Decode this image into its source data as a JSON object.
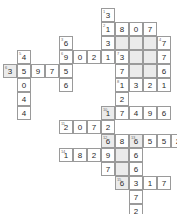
{
  "puzzle": {
    "kind": "number-crossword-grid",
    "title": "",
    "cell_size_px": 14,
    "origin_x_px": 3,
    "origin_y_px": 8,
    "colors": {
      "cell_background": "#ffffff",
      "shaded_background": "#ebebeb",
      "border": "#9a9a9a",
      "digit_text": "#2b2b2b",
      "clue_number_text": "#6b6b6b"
    },
    "cells": [
      {
        "col": 7,
        "row": 0,
        "digit": "3",
        "clue": "1",
        "shaded": false
      },
      {
        "col": 7,
        "row": 1,
        "digit": "1",
        "clue": "2",
        "shaded": false
      },
      {
        "col": 8,
        "row": 1,
        "digit": "8",
        "clue": "",
        "shaded": false
      },
      {
        "col": 9,
        "row": 1,
        "digit": "0",
        "clue": "",
        "shaded": false
      },
      {
        "col": 10,
        "row": 1,
        "digit": "7",
        "clue": "",
        "shaded": false
      },
      {
        "col": 4,
        "row": 2,
        "digit": "6",
        "clue": "3",
        "shaded": false
      },
      {
        "col": 7,
        "row": 2,
        "digit": "3",
        "clue": "",
        "shaded": false
      },
      {
        "col": 8,
        "row": 2,
        "digit": "",
        "clue": "",
        "shaded": true
      },
      {
        "col": 9,
        "row": 2,
        "digit": "",
        "clue": "",
        "shaded": true
      },
      {
        "col": 10,
        "row": 2,
        "digit": "",
        "clue": "",
        "shaded": true
      },
      {
        "col": 11,
        "row": 2,
        "digit": "7",
        "clue": "4",
        "shaded": false
      },
      {
        "col": 1,
        "row": 3,
        "digit": "4",
        "clue": "5",
        "shaded": false
      },
      {
        "col": 4,
        "row": 3,
        "digit": "9",
        "clue": "6",
        "shaded": false
      },
      {
        "col": 5,
        "row": 3,
        "digit": "0",
        "clue": "",
        "shaded": false
      },
      {
        "col": 6,
        "row": 3,
        "digit": "2",
        "clue": "",
        "shaded": false
      },
      {
        "col": 7,
        "row": 3,
        "digit": "1",
        "clue": "",
        "shaded": false
      },
      {
        "col": 8,
        "row": 3,
        "digit": "3",
        "clue": "7",
        "shaded": false
      },
      {
        "col": 9,
        "row": 3,
        "digit": "",
        "clue": "",
        "shaded": true
      },
      {
        "col": 10,
        "row": 3,
        "digit": "",
        "clue": "",
        "shaded": true
      },
      {
        "col": 11,
        "row": 3,
        "digit": "7",
        "clue": "",
        "shaded": false
      },
      {
        "col": 0,
        "row": 4,
        "digit": "3",
        "clue": "6",
        "shaded": true
      },
      {
        "col": 1,
        "row": 4,
        "digit": "5",
        "clue": "",
        "shaded": false
      },
      {
        "col": 2,
        "row": 4,
        "digit": "9",
        "clue": "",
        "shaded": false
      },
      {
        "col": 3,
        "row": 4,
        "digit": "7",
        "clue": "",
        "shaded": false
      },
      {
        "col": 4,
        "row": 4,
        "digit": "5",
        "clue": "",
        "shaded": false
      },
      {
        "col": 8,
        "row": 4,
        "digit": "7",
        "clue": "",
        "shaded": false
      },
      {
        "col": 9,
        "row": 4,
        "digit": "",
        "clue": "",
        "shaded": true
      },
      {
        "col": 10,
        "row": 4,
        "digit": "",
        "clue": "",
        "shaded": true
      },
      {
        "col": 11,
        "row": 4,
        "digit": "6",
        "clue": "",
        "shaded": false
      },
      {
        "col": 1,
        "row": 5,
        "digit": "0",
        "clue": "",
        "shaded": false
      },
      {
        "col": 4,
        "row": 5,
        "digit": "6",
        "clue": "",
        "shaded": false
      },
      {
        "col": 8,
        "row": 5,
        "digit": "1",
        "clue": "8",
        "shaded": false
      },
      {
        "col": 9,
        "row": 5,
        "digit": "3",
        "clue": "",
        "shaded": false
      },
      {
        "col": 10,
        "row": 5,
        "digit": "2",
        "clue": "",
        "shaded": false
      },
      {
        "col": 11,
        "row": 5,
        "digit": "1",
        "clue": "",
        "shaded": false
      },
      {
        "col": 1,
        "row": 6,
        "digit": "4",
        "clue": "",
        "shaded": false
      },
      {
        "col": 8,
        "row": 6,
        "digit": "2",
        "clue": "",
        "shaded": false
      },
      {
        "col": 1,
        "row": 7,
        "digit": "4",
        "clue": "",
        "shaded": false
      },
      {
        "col": 7,
        "row": 7,
        "digit": "1",
        "clue": "10",
        "shaded": true
      },
      {
        "col": 8,
        "row": 7,
        "digit": "7",
        "clue": "",
        "shaded": false
      },
      {
        "col": 9,
        "row": 7,
        "digit": "4",
        "clue": "",
        "shaded": false
      },
      {
        "col": 10,
        "row": 7,
        "digit": "9",
        "clue": "",
        "shaded": false
      },
      {
        "col": 11,
        "row": 7,
        "digit": "6",
        "clue": "",
        "shaded": false
      },
      {
        "col": 4,
        "row": 8,
        "digit": "2",
        "clue": "11",
        "shaded": false
      },
      {
        "col": 5,
        "row": 8,
        "digit": "0",
        "clue": "",
        "shaded": false
      },
      {
        "col": 6,
        "row": 8,
        "digit": "7",
        "clue": "",
        "shaded": false
      },
      {
        "col": 7,
        "row": 8,
        "digit": "2",
        "clue": "",
        "shaded": false
      },
      {
        "col": 7,
        "row": 9,
        "digit": "6",
        "clue": "12",
        "shaded": true
      },
      {
        "col": 8,
        "row": 9,
        "digit": "8",
        "clue": "",
        "shaded": false
      },
      {
        "col": 9,
        "row": 9,
        "digit": "6",
        "clue": "13",
        "shaded": true
      },
      {
        "col": 10,
        "row": 9,
        "digit": "5",
        "clue": "",
        "shaded": false
      },
      {
        "col": 11,
        "row": 9,
        "digit": "5",
        "clue": "",
        "shaded": false
      },
      {
        "col": 12,
        "row": 9,
        "digit": "2",
        "clue": "",
        "shaded": false
      },
      {
        "col": 4,
        "row": 10,
        "digit": "1",
        "clue": "14",
        "shaded": false
      },
      {
        "col": 5,
        "row": 10,
        "digit": "8",
        "clue": "",
        "shaded": false
      },
      {
        "col": 6,
        "row": 10,
        "digit": "2",
        "clue": "",
        "shaded": false
      },
      {
        "col": 7,
        "row": 10,
        "digit": "9",
        "clue": "",
        "shaded": false
      },
      {
        "col": 8,
        "row": 10,
        "digit": "",
        "clue": "",
        "shaded": true
      },
      {
        "col": 9,
        "row": 10,
        "digit": "6",
        "clue": "",
        "shaded": false
      },
      {
        "col": 7,
        "row": 11,
        "digit": "7",
        "clue": "",
        "shaded": false
      },
      {
        "col": 8,
        "row": 11,
        "digit": "",
        "clue": "",
        "shaded": true
      },
      {
        "col": 9,
        "row": 11,
        "digit": "6",
        "clue": "",
        "shaded": false
      },
      {
        "col": 8,
        "row": 12,
        "digit": "6",
        "clue": "15",
        "shaded": true
      },
      {
        "col": 9,
        "row": 12,
        "digit": "3",
        "clue": "",
        "shaded": false
      },
      {
        "col": 10,
        "row": 12,
        "digit": "1",
        "clue": "",
        "shaded": false
      },
      {
        "col": 11,
        "row": 12,
        "digit": "7",
        "clue": "",
        "shaded": false
      },
      {
        "col": 9,
        "row": 13,
        "digit": "7",
        "clue": "",
        "shaded": false
      },
      {
        "col": 9,
        "row": 14,
        "digit": "2",
        "clue": "",
        "shaded": false
      }
    ]
  }
}
